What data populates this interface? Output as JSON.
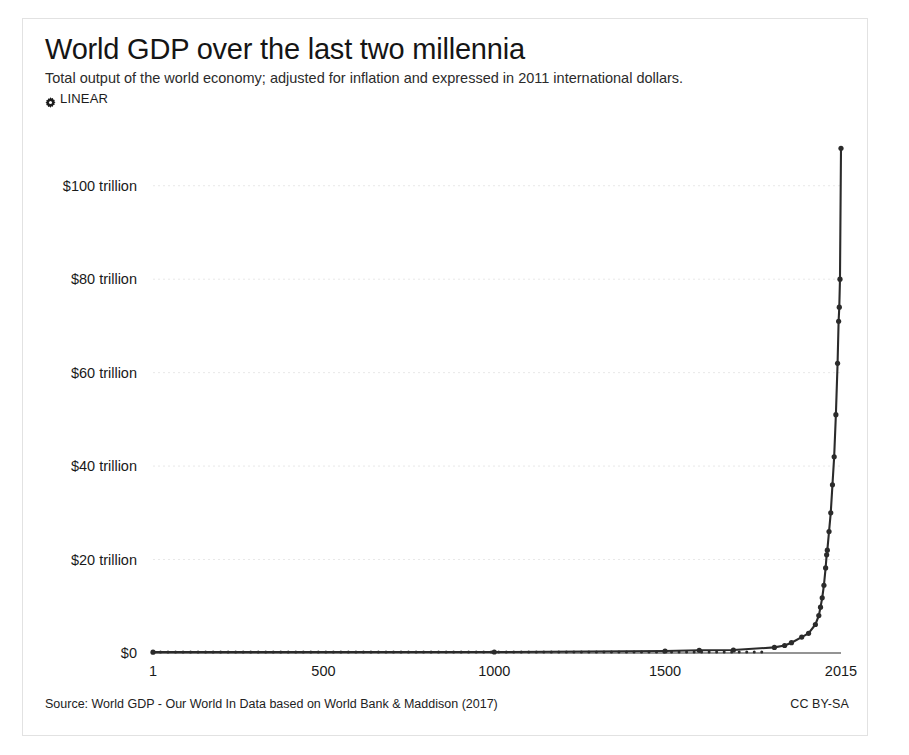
{
  "header": {
    "title": "World GDP over the last two millennia",
    "subtitle": "Total output of the world economy; adjusted for inflation and expressed in 2011 international dollars.",
    "axis_toggle_label": "LINEAR",
    "axis_toggle_icon": "gear-icon"
  },
  "footer": {
    "source": "Source: World GDP - Our World In Data based on World Bank & Maddison (2017)",
    "license": "CC BY-SA"
  },
  "colors": {
    "line": "#2b2b2b",
    "marker": "#2b2b2b",
    "grid": "#e8e8e8",
    "axis": "#2b2b2b",
    "card_border": "#e2e2e2",
    "text": "#1a1a1a"
  },
  "chart_data": {
    "type": "line",
    "title": "World GDP over the last two millennia",
    "subtitle": "Total output of the world economy; adjusted for inflation and expressed in 2011 international dollars.",
    "xlabel": "",
    "ylabel": "",
    "xscale": "linear",
    "yscale": "linear",
    "xlim": [
      1,
      2015
    ],
    "ylim": [
      0,
      110
    ],
    "y_unit": "trillion 2011 international dollars",
    "grid": true,
    "grid_axis": "y",
    "legend": false,
    "markers": true,
    "xticks": [
      1,
      500,
      1000,
      1500,
      2015
    ],
    "xtick_labels": [
      "1",
      "500",
      "1000",
      "1500",
      "2015"
    ],
    "yticks": [
      0,
      20,
      40,
      60,
      80,
      100
    ],
    "ytick_labels": [
      "$0",
      "$20 trillion",
      "$40 trillion",
      "$60 trillion",
      "$80 trillion",
      "$100 trillion"
    ],
    "series": [
      {
        "name": "World GDP",
        "x": [
          1,
          1000,
          1500,
          1600,
          1700,
          1820,
          1850,
          1870,
          1900,
          1920,
          1940,
          1950,
          1955,
          1960,
          1965,
          1970,
          1973,
          1975,
          1980,
          1985,
          1990,
          1995,
          2000,
          2005,
          2008,
          2010,
          2012,
          2015
        ],
        "values": [
          0.18,
          0.21,
          0.43,
          0.58,
          0.64,
          1.2,
          1.6,
          2.2,
          3.4,
          4.2,
          6.1,
          8.0,
          9.8,
          11.8,
          14.5,
          18.2,
          21.0,
          22.0,
          26.0,
          30.0,
          36.0,
          42.0,
          51.0,
          62.0,
          71.0,
          74.0,
          80.0,
          108.0
        ]
      }
    ]
  }
}
